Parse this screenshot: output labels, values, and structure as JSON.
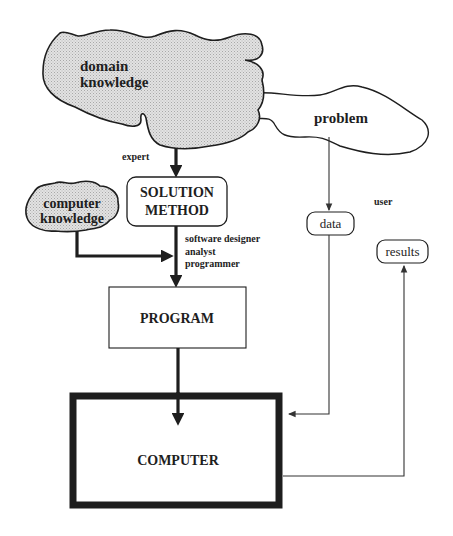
{
  "diagram": {
    "clouds": {
      "domain_knowledge": {
        "line1": "domain",
        "line2": "knowledge"
      },
      "problem": {
        "label": "problem"
      },
      "computer_knowledge": {
        "line1": "computer",
        "line2": "knowledge"
      }
    },
    "boxes": {
      "solution_method": {
        "line1": "SOLUTION",
        "line2": "METHOD"
      },
      "program": {
        "label": "PROGRAM"
      },
      "computer": {
        "label": "COMPUTER"
      },
      "data": {
        "label": "data"
      },
      "results": {
        "label": "results"
      }
    },
    "roles": {
      "expert": "expert",
      "user": "user",
      "software_designer": "software designer",
      "analyst": "analyst",
      "programmer": "programmer"
    },
    "colors": {
      "ink": "#1e1e1e",
      "cloud_shade": "#d6d6d6",
      "background": "#ffffff"
    }
  }
}
